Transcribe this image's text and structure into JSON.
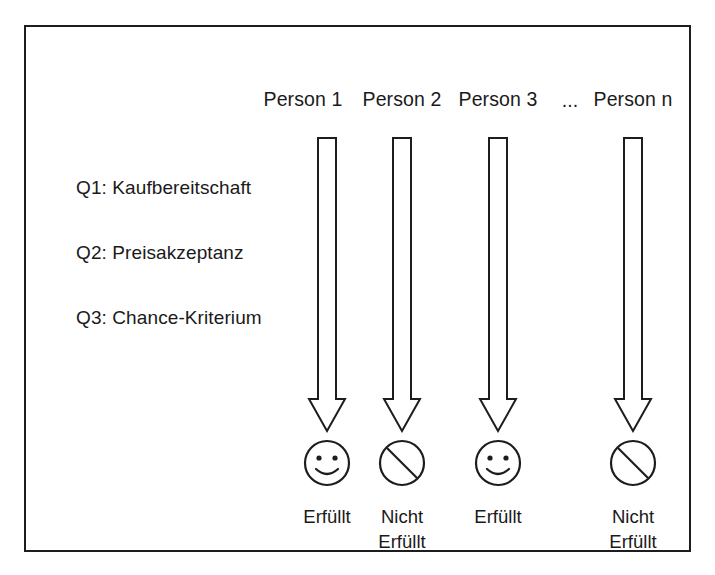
{
  "diagram": {
    "border_color": "#1d1d1d",
    "background_color": "#ffffff",
    "ink_color": "#1a1a1a",
    "columns": [
      {
        "header": "Person 1",
        "center_x": 301,
        "arrow": "down-arrow-outline",
        "outcome_icon": "smiley-face-icon",
        "outcome_label": "Erfüllt"
      },
      {
        "header": "Person 2",
        "center_x": 376,
        "arrow": "down-arrow-outline",
        "outcome_icon": "prohibited-circle-icon",
        "outcome_label": "Nicht\nErfüllt"
      },
      {
        "header": "Person 3",
        "center_x": 472,
        "arrow": "down-arrow-outline",
        "outcome_icon": "smiley-face-icon",
        "outcome_label": "Erfüllt"
      },
      {
        "header": "Person n",
        "center_x": 607,
        "arrow": "down-arrow-outline",
        "outcome_icon": "prohibited-circle-icon",
        "outcome_label": "Nicht\nErfüllt"
      }
    ],
    "ellipsis": {
      "text": "...",
      "center_x": 544
    },
    "criteria": [
      {
        "text": "Q1: Kaufbereitschaft"
      },
      {
        "text": "Q2: Preisakzeptanz"
      },
      {
        "text": "Q3: Chance-Kriterium"
      }
    ]
  }
}
